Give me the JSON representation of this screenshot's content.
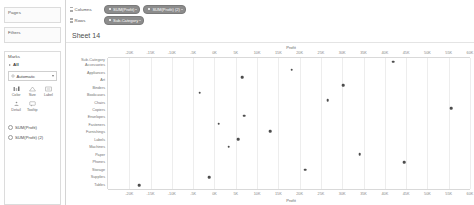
{
  "left_panel": {
    "pages_label": "Pages",
    "filters_label": "Filters",
    "marks": {
      "title": "Marks",
      "all_label": "All",
      "mark_type": "Automatic",
      "buttons": [
        {
          "label": "Color",
          "icon": "color-icon"
        },
        {
          "label": "Size",
          "icon": "size-icon"
        },
        {
          "label": "Label",
          "icon": "label-icon"
        },
        {
          "label": "Detail",
          "icon": "detail-icon"
        },
        {
          "label": "Tooltip",
          "icon": "tooltip-icon"
        }
      ],
      "pills": [
        "SUM(Profit)",
        "SUM(Profit) (2)"
      ]
    }
  },
  "shelves": {
    "columns_label": "Columns",
    "rows_label": "Rows",
    "columns_pills": [
      "SUM(Profit)",
      "SUM(Profit) (2)"
    ],
    "rows_pills": [
      "Sub-Category"
    ]
  },
  "sheet": {
    "title": "Sheet 14"
  },
  "chart_data": {
    "type": "scatter",
    "title": "Sheet 14",
    "xlabel": "Profit",
    "ylabel": "Sub-Category",
    "axis_title_top": "Profit",
    "axis_title_bottom": "Profit",
    "grid": true,
    "legend": "none",
    "xlim": [
      -25000,
      60000
    ],
    "xticks": [
      -20000,
      -15000,
      -10000,
      -5000,
      0,
      5000,
      10000,
      15000,
      20000,
      25000,
      30000,
      35000,
      40000,
      45000,
      50000,
      55000,
      60000
    ],
    "xticklabels": [
      "-20K",
      "-15K",
      "-10K",
      "-5K",
      "0K",
      "5K",
      "10K",
      "15K",
      "20K",
      "25K",
      "30K",
      "35K",
      "40K",
      "45K",
      "50K",
      "55K",
      "60K"
    ],
    "categories": [
      "Accessories",
      "Appliances",
      "Art",
      "Binders",
      "Bookcases",
      "Chairs",
      "Copiers",
      "Envelopes",
      "Fasteners",
      "Furnishings",
      "Labels",
      "Machines",
      "Paper",
      "Phones",
      "Storage",
      "Supplies",
      "Tables"
    ],
    "values": [
      41937,
      18138,
      6528,
      30222,
      -3473,
      26590,
      55618,
      6964,
      950,
      13059,
      5546,
      3385,
      34054,
      44516,
      21279,
      -1189,
      -17725
    ],
    "points": [
      {
        "category": "Accessories",
        "value": 41937
      },
      {
        "category": "Appliances",
        "value": 18138
      },
      {
        "category": "Art",
        "value": 6528
      },
      {
        "category": "Binders",
        "value": 30222
      },
      {
        "category": "Bookcases",
        "value": -3473
      },
      {
        "category": "Chairs",
        "value": 26590
      },
      {
        "category": "Copiers",
        "value": 55618
      },
      {
        "category": "Envelopes",
        "value": 6964
      },
      {
        "category": "Fasteners",
        "value": 950
      },
      {
        "category": "Furnishings",
        "value": 13059
      },
      {
        "category": "Labels",
        "value": 5546
      },
      {
        "category": "Machines",
        "value": 3385
      },
      {
        "category": "Paper",
        "value": 34054
      },
      {
        "category": "Phones",
        "value": 44516
      },
      {
        "category": "Storage",
        "value": 21279
      },
      {
        "category": "Supplies",
        "value": -1189
      },
      {
        "category": "Tables",
        "value": -17725
      }
    ]
  }
}
